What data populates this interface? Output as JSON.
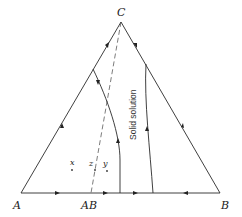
{
  "diagram": {
    "type": "ternary-phase-diagram",
    "vertices": {
      "A": {
        "label": "A"
      },
      "B": {
        "label": "B"
      },
      "C": {
        "label": "C"
      }
    },
    "compound_label": "AB",
    "points": [
      {
        "id": "x",
        "label": "x"
      },
      {
        "id": "z",
        "label": "z"
      },
      {
        "id": "y",
        "label": "y"
      }
    ],
    "region_label": "Solid solution",
    "colors": {
      "line": "#2a2a2a",
      "background": "#ffffff"
    }
  }
}
